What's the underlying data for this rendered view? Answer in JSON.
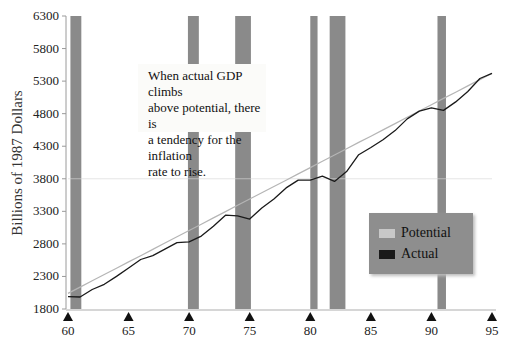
{
  "chart_data": {
    "type": "line",
    "title": "",
    "xlabel": "",
    "ylabel": "Billions of 1987 Dollars",
    "xlim": [
      60,
      95
    ],
    "ylim": [
      1800,
      6300
    ],
    "x_ticks": [
      "60",
      "65",
      "70",
      "75",
      "80",
      "85",
      "90",
      "95"
    ],
    "y_ticks": [
      "1800",
      "2300",
      "2800",
      "3300",
      "3800",
      "4300",
      "4800",
      "5300",
      "5800",
      "6300"
    ],
    "grid": false,
    "legend_position": "lower right",
    "x": [
      60,
      61,
      62,
      63,
      64,
      65,
      66,
      67,
      68,
      69,
      70,
      71,
      72,
      73,
      74,
      75,
      76,
      77,
      78,
      79,
      80,
      81,
      82,
      83,
      84,
      85,
      86,
      87,
      88,
      89,
      90,
      91,
      92,
      93,
      94,
      95
    ],
    "series": [
      {
        "name": "Potential",
        "color": "#b5b5b5",
        "values": [
          2040,
          2137,
          2233,
          2330,
          2426,
          2523,
          2619,
          2716,
          2813,
          2909,
          3006,
          3102,
          3199,
          3296,
          3392,
          3489,
          3585,
          3682,
          3778,
          3875,
          3971,
          4068,
          4165,
          4261,
          4358,
          4454,
          4551,
          4648,
          4744,
          4841,
          4937,
          5034,
          5130,
          5227,
          5323,
          5420
        ]
      },
      {
        "name": "Actual",
        "color": "#1a1a1a",
        "values": [
          1990,
          1985,
          2100,
          2180,
          2300,
          2430,
          2560,
          2620,
          2720,
          2820,
          2830,
          2920,
          3070,
          3240,
          3230,
          3180,
          3350,
          3490,
          3660,
          3780,
          3780,
          3840,
          3760,
          3910,
          4170,
          4280,
          4400,
          4540,
          4720,
          4840,
          4890,
          4850,
          4980,
          5140,
          5340,
          5420
        ]
      }
    ],
    "shaded_regions_label": "Recessions",
    "shaded_regions": [
      [
        60.2,
        61.1
      ],
      [
        69.9,
        70.8
      ],
      [
        73.8,
        75.1
      ],
      [
        80.0,
        80.6
      ],
      [
        81.6,
        82.9
      ],
      [
        90.5,
        91.2
      ]
    ],
    "annotations": [
      "When actual GDP climbs above potential, there is a tendency for the inflation rate to rise."
    ]
  },
  "annotation": {
    "lines": [
      "When actual GDP climbs",
      "above potential, there is",
      "a tendency for the inflation",
      "rate to rise."
    ]
  },
  "legend": {
    "items": [
      {
        "label": "Potential",
        "color": "#c8c8c8"
      },
      {
        "label": "Actual",
        "color": "#1a1a1a"
      }
    ]
  },
  "colors": {
    "recession_bar": "#8a8a8a",
    "axis": "#9a9a9a",
    "marker": "#111111"
  }
}
